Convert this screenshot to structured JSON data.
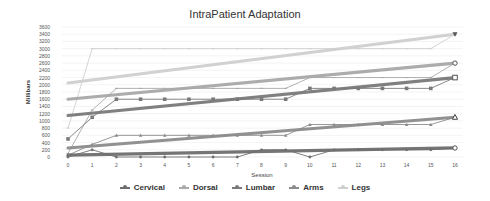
{
  "chart_data": {
    "type": "line",
    "title": "IntraPatient Adaptation",
    "xlabel": "Session",
    "ylabel": "Millibars",
    "x": [
      0,
      1,
      2,
      3,
      4,
      5,
      6,
      7,
      8,
      9,
      10,
      11,
      12,
      13,
      14,
      15,
      16
    ],
    "ylim": [
      0,
      3600
    ],
    "yticks": [
      0,
      200,
      400,
      600,
      800,
      1000,
      1200,
      1400,
      1600,
      1800,
      2000,
      2200,
      2400,
      2600,
      2800,
      3000,
      3200,
      3400,
      3600
    ],
    "grid": true,
    "legend_position": "bottom",
    "series": [
      {
        "name": "Cervical",
        "color": "#6e6e6e",
        "marker": "circle",
        "values": [
          0,
          200,
          0,
          0,
          0,
          0,
          0,
          0,
          200,
          200,
          0,
          200,
          200,
          200,
          200,
          200,
          250
        ],
        "trend": [
          50,
          250
        ]
      },
      {
        "name": "Dorsal",
        "color": "#a8a8a8",
        "marker": "dash",
        "values": [
          100,
          1300,
          1900,
          1900,
          1900,
          1900,
          1900,
          1900,
          1900,
          1900,
          2200,
          2200,
          2200,
          2200,
          2200,
          2200,
          2600
        ],
        "trend": [
          1600,
          2600
        ]
      },
      {
        "name": "Lumbar",
        "color": "#7a7a7a",
        "marker": "square",
        "values": [
          500,
          1100,
          1600,
          1600,
          1600,
          1600,
          1600,
          1600,
          1600,
          1600,
          1900,
          1900,
          1900,
          1900,
          1900,
          1900,
          2200
        ],
        "trend": [
          1150,
          2200
        ]
      },
      {
        "name": "Arms",
        "color": "#8c8c8c",
        "marker": "triangle",
        "values": [
          50,
          350,
          600,
          600,
          600,
          600,
          600,
          600,
          600,
          600,
          900,
          900,
          900,
          900,
          900,
          900,
          1100
        ],
        "trend": [
          250,
          1100
        ]
      },
      {
        "name": "Legs",
        "color": "#cfcfcf",
        "marker": "dash",
        "values": [
          800,
          3000,
          3000,
          3000,
          3000,
          3000,
          3000,
          3000,
          3000,
          3000,
          3000,
          3000,
          3000,
          3000,
          3000,
          3000,
          3400
        ],
        "trend": [
          2050,
          3400
        ]
      }
    ]
  }
}
